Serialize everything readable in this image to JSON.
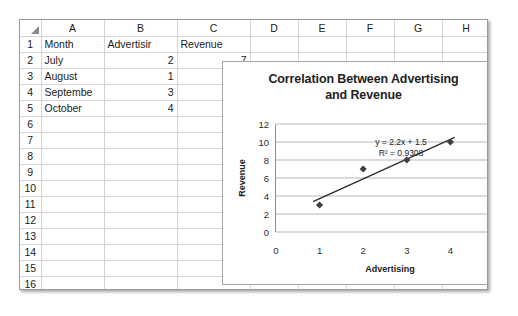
{
  "spreadsheet": {
    "columns": [
      "A",
      "B",
      "C",
      "D",
      "E",
      "F",
      "G",
      "H",
      "I"
    ],
    "row_numbers": [
      "1",
      "2",
      "3",
      "4",
      "5",
      "6",
      "7",
      "8",
      "9",
      "10",
      "11",
      "12",
      "13",
      "14",
      "15",
      "16"
    ],
    "cells": {
      "headers": {
        "a": "Month",
        "b": "Advertisir",
        "c": "Revenue"
      },
      "rows": [
        {
          "month": "July",
          "advertising": "2",
          "revenue": "7"
        },
        {
          "month": "August",
          "advertising": "1",
          "revenue": "3"
        },
        {
          "month": "Septembe",
          "advertising": "3",
          "revenue": "8"
        },
        {
          "month": "October",
          "advertising": "4",
          "revenue": "10"
        }
      ]
    }
  },
  "chart_data": {
    "type": "scatter",
    "title": "Correlation Between Advertising and Revenue",
    "title_line1": "Correlation Between Advertising",
    "title_line2": "and Revenue",
    "xlabel": "Advertising",
    "ylabel": "Revenue",
    "x": [
      1,
      2,
      3,
      4
    ],
    "y": [
      3,
      7,
      8,
      10
    ],
    "points": [
      {
        "x": 1,
        "y": 3
      },
      {
        "x": 2,
        "y": 7
      },
      {
        "x": 3,
        "y": 8
      },
      {
        "x": 4,
        "y": 10
      }
    ],
    "xlim": [
      0,
      5
    ],
    "ylim": [
      0,
      12
    ],
    "xticks": [
      "0",
      "1",
      "2",
      "3",
      "4",
      "5"
    ],
    "yticks": [
      "0",
      "2",
      "4",
      "6",
      "8",
      "10",
      "12"
    ],
    "grid": "horizontal",
    "legend": "none",
    "marker": "diamond",
    "marker_color": "#3f3f3f",
    "trendline": {
      "equation": "y = 2.2x + 1.5",
      "r_squared": "R² = 0.9308",
      "slope": 2.2,
      "intercept": 1.5,
      "x_start": 0.85,
      "x_end": 4.1,
      "color": "#2b2b2b"
    }
  }
}
